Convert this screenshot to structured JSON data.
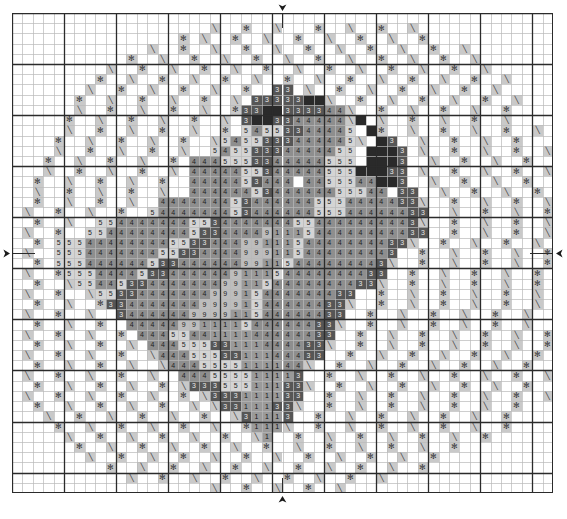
{
  "document": {
    "kind": "cross-stitch-pattern-chart",
    "title": "Cross Stitch Pattern Chart",
    "grid": {
      "columns": 52,
      "rows": 47,
      "cell_px": 10.4,
      "major_line_every": 5,
      "minor_line_color": "#b9b9b9",
      "major_line_color": "#2b2b2b",
      "frame_color": "#2b2b2b",
      "background_color": "#ffffff"
    },
    "center_markers": [
      {
        "name": "top-center-marker",
        "glyph": "down-arrow",
        "position": "top"
      },
      {
        "name": "left-center-marker",
        "glyph": "right-arrow",
        "position": "left"
      },
      {
        "name": "right-center-marker",
        "glyph": "left-arrow",
        "position": "right"
      },
      {
        "name": "bottom-center-marker",
        "glyph": "up-arrow",
        "position": "bottom"
      }
    ],
    "symbols": [
      {
        "key": "\\",
        "name": "backslash-stitch",
        "swatch": "#c9c9c9",
        "ink": "#3a3a3a"
      },
      {
        "key": "*",
        "name": "asterisk-stitch",
        "swatch": "#c9c9c9",
        "ink": "#3a3a3a"
      },
      {
        "key": "2",
        "name": "digit-two-stitch",
        "swatch": "#6a6a6a",
        "ink": "#e8e8e8"
      },
      {
        "key": "3",
        "name": "digit-three-stitch",
        "swatch": "#565656",
        "ink": "#e8e8e8"
      },
      {
        "key": "4",
        "name": "digit-four-stitch",
        "swatch": "#8e8e8e",
        "ink": "#1e1e1e"
      },
      {
        "key": "5",
        "name": "digit-five-stitch",
        "swatch": "#d4d4d4",
        "ink": "#1e1e1e"
      },
      {
        "key": "9",
        "name": "digit-nine-stitch",
        "swatch": "#bdbdbd",
        "ink": "#1e1e1e"
      },
      {
        "key": "1",
        "name": "digit-one-stitch",
        "swatch": "#9a9a9a",
        "ink": "#141414"
      },
      {
        "key": "|",
        "name": "bar-stitch",
        "swatch": "#b0b0b0",
        "ink": "#141414"
      },
      {
        "key": "#",
        "name": "dark-fill-stitch",
        "swatch": "#3c3c3c",
        "ink": "#cfcfcf"
      },
      {
        "key": "0",
        "name": "darkest-fill-stitch",
        "swatch": "#2a2a2a",
        "ink": "#bdbdbd"
      },
      {
        "key": "w",
        "name": "white-stitch",
        "swatch": "#ffffff",
        "ink": "#ffffff"
      },
      {
        "key": ".",
        "name": "empty-cell",
        "swatch": "#ffffff",
        "ink": "#ffffff"
      }
    ],
    "legend_note": "Symbol grid rows are encoded left-to-right; '.' marks an unstitched cell."
  },
  "chart_data": {
    "type": "heatmap",
    "xlabel": "",
    "ylabel": "",
    "columns": 52,
    "rows": 47,
    "grid_rows": [
      "....................................................",
      "...................\\..*..\\...*..\\..*..\\.............",
      "................*.\\..*..\\..*..\\..*..\\..*............",
      ".............\\..*..\\..*..\\..*..\\..*..\\..*..\\........",
      "...........*..\\..*..\\..*..\\..*..\\..*..\\..*..\\.......",
      ".........\\..*..\\..*..\\..*..\\..*..\\..*..\\..*..\\......",
      "........*..\\..*..\\..*..\\..*..\\..*..\\..*..\\..*..\\....",
      ".......\\..*..\\..*..\\..*..33.\\..*..\\..*..\\..*..\\.....",
      "......*..\\..*..\\..*..\\.3333300\\..*..\\..*..\\..*..\\...",
      "......\\..*..\\..*..\\..*3300333344\\..*..\\..*..\\..*....",
      ".....*..\\..*..\\..*..\\.3003344444\\0.\\..*..\\..*..\\....",
      ".....\\..*..\\..*..\\..*.54553344445.0*..\\..*..\\..*..\\.",
      "....*..\\..*..\\..*..\\5455333444445\\.03..\\..*..\\..*...",
      "....\\..*..\\..*..\\..54553334444455.0003.\\..*..\\..*..\\",
      "...*..\\..*..\\..*.4445553344444555.0003..\\..*..\\..*..",
      "...\\..*..\\..*..\\.444445534444455500033.\\..*..\\..*..\\",
      "..*..\\..*..\\..*..4444453444w4455544003..\\..*..\\..*..",
      "..\\..*..\\..*..\\..4444445344444455544.33..\\..*..\\..*.",
      "..*..\\..*..\\..4444444534444445554444433\\..*..\\..*..\\",
      ".\\..*..\\..*..544444445344444455544444433..\\..*..\\..*",
      "..*..\\..5544444445534444444554444444443\\..*..\\..*..\\",
      ".\\..*..554444444453344449111544444444433..*..\\..*..\\",
      "..*.5554444444455334449911154444444433\\..*..\\..*..\\.",
      ".\\..555444444455334444999115444444443..*..\\..*..\\..*",
      "..*.55544444453344444499115444444443\\..*..\\..*..\\..*",
      ".\\..*5554444533444444911154444444433..*..\\..*..\\..*.",
      "..*..\\55445334444444991154444444433\\..*..\\..*..\\..*.",
      ".\\..*..\\5533444444499915444444433..*..\\..*..\\..*..\\.",
      "..*..\\..*33444444499991544444433\\..*..\\..*..\\..*..\\.",
      ".\\..*..\\..3444444999911544444433..*..\\..*..\\..*..\\..",
      "..*..\\..*..44444991111544444433\\..*..\\..*..\\..*..\\..",
      ".\\..*..\\..*.4445544111144444433..*..\\..*..\\..*..\\..*",
      "..*..\\..*..\\.44455533111444433\\..*..\\..*..\\..*..\\..*",
      ".\\..*..\\..*..\\4445553311144433..*..\\..*..\\..*..\\..*.",
      "..*..\\..*..\\..\\4445555111144\\..*..\\..*..\\..*..\\..*..",
      ".\\..*..\\..*..\\..444555511113..*..\\..*..\\..*..\\..*..\\",
      "..*..\\..*..\\..*.\\33355511133\\..*..\\..*..\\..*..\\..*..",
      ".\\..*..\\..*..\\..*.\\333111133..*..\\..*..\\..*..\\..*..\\",
      "..*..\\..*..\\..*..\\.\\3311133\\..*..\\..*..\\..*..\\..*...",
      "...\\..*..\\..*..\\..*..\\31113..*..\\..*..\\..*..\\..*....",
      "....*..\\..*..\\..*..\\..*111\\..*..\\..*..\\..*..\\..*....",
      ".....\\..*..\\..*..\\..*..\\1..*..\\..*..\\..*..\\..*......",
      "......*..\\..*..\\..*..\\..*..\\..*..\\..*..\\..*.........",
      ".......\\..*..\\..*..\\..*..\\..*..\\..*..\\..*...........",
      ".........*..\\..*..\\..*..\\..*..\\..*..\\..*............",
      "...........\\..*..\\..*..\\..*..\\..*..\\................",
      "...................\\..*..\\..*..\\...................."
    ],
    "legend": [
      {
        "symbol": "\\",
        "label": "backslash-stitch"
      },
      {
        "symbol": "*",
        "label": "asterisk-stitch"
      },
      {
        "symbol": "1",
        "label": "digit-one-stitch"
      },
      {
        "symbol": "3",
        "label": "digit-three-stitch"
      },
      {
        "symbol": "4",
        "label": "digit-four-stitch"
      },
      {
        "symbol": "5",
        "label": "digit-five-stitch"
      },
      {
        "symbol": "9",
        "label": "digit-nine-stitch"
      },
      {
        "symbol": "0",
        "label": "darkest-fill-stitch"
      },
      {
        "symbol": "w",
        "label": "white-stitch"
      }
    ],
    "grid": true,
    "legend_position": "none"
  }
}
